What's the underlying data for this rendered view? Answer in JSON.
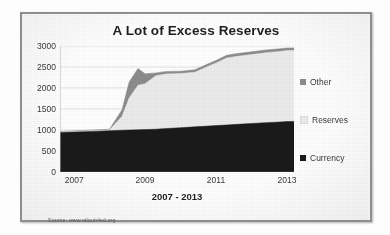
{
  "figure": {
    "source_note": "Source: www.stlouisfed.org"
  },
  "legend": {
    "position": "right",
    "items": [
      {
        "label": "Other",
        "color": "#8c8c8c",
        "swatch_name": "legend-swatch-other"
      },
      {
        "label": "Reserves",
        "color": "#ececec",
        "swatch_name": "legend-swatch-reserves"
      },
      {
        "label": "Currency",
        "color": "#1a1a1a",
        "swatch_name": "legend-swatch-currency"
      }
    ]
  },
  "chart_data": {
    "type": "area",
    "stacked": true,
    "title": "A Lot of Excess Reserves",
    "xlabel": "2007 - 2013",
    "ylabel": "",
    "grid": true,
    "xlim": [
      2006.6,
      2013.2
    ],
    "ylim": [
      0,
      3000
    ],
    "yticks": [
      0,
      500,
      1000,
      1500,
      2000,
      2500,
      3000
    ],
    "ytick_labels": [
      "0",
      "500",
      "1000",
      "1500",
      "2000",
      "2500",
      "3000"
    ],
    "xticks": [
      2007,
      2009,
      2011,
      2013
    ],
    "xtick_labels": [
      "2007",
      "2009",
      "2011",
      "2013"
    ],
    "x": [
      2006.6,
      2007.0,
      2007.5,
      2008.0,
      2008.35,
      2008.55,
      2008.8,
      2009.0,
      2009.3,
      2009.6,
      2010.0,
      2010.4,
      2010.8,
      2011.0,
      2011.3,
      2011.6,
      2012.0,
      2012.4,
      2012.8,
      2013.0,
      2013.2
    ],
    "series": [
      {
        "name": "Currency",
        "color": "#1a1a1a",
        "values": [
          940,
          950,
          965,
          985,
          995,
          1000,
          1005,
          1010,
          1020,
          1035,
          1055,
          1075,
          1095,
          1105,
          1120,
          1135,
          1155,
          1175,
          1190,
          1200,
          1205
        ]
      },
      {
        "name": "Reserves",
        "color": "#ececec",
        "values": [
          15,
          18,
          20,
          22,
          330,
          760,
          1060,
          1090,
          1270,
          1300,
          1290,
          1300,
          1430,
          1490,
          1595,
          1620,
          1640,
          1665,
          1680,
          1690,
          1690
        ]
      },
      {
        "name": "Other",
        "color": "#8c8c8c",
        "values": [
          10,
          12,
          13,
          14,
          160,
          380,
          400,
          240,
          70,
          60,
          55,
          58,
          60,
          62,
          64,
          66,
          66,
          66,
          64,
          62,
          60
        ]
      }
    ],
    "series_totals_note": "Stacked total rises from ~965 in 2007 to ~2955 in 2013",
    "annotations": []
  }
}
